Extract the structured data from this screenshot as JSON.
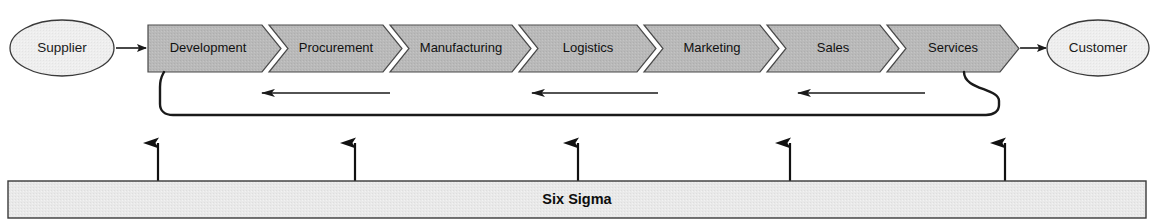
{
  "diagram": {
    "endpoints": {
      "source": {
        "label": "Supplier",
        "shape": "ellipse"
      },
      "target": {
        "label": "Customer",
        "shape": "ellipse"
      }
    },
    "stages": [
      {
        "label": "Development"
      },
      {
        "label": "Procurement"
      },
      {
        "label": "Manufacturing"
      },
      {
        "label": "Logistics"
      },
      {
        "label": "Marketing"
      },
      {
        "label": "Sales"
      },
      {
        "label": "Services"
      }
    ],
    "foundation": {
      "label": "Six Sigma"
    },
    "feedback": {
      "arrow_count": 3,
      "direction": "right-to-left",
      "description": "Feedback loop from Services back to Development"
    },
    "support_arrows": {
      "count": 5,
      "direction": "up",
      "description": "Six Sigma supports the process chain"
    },
    "colors": {
      "stage_fill": "#b9b9b9",
      "endpoint_fill": "#eeeeee",
      "foundation_fill": "#e6e6e6",
      "outline": "#3a3a3a",
      "text": "#111111",
      "background": "#ffffff"
    }
  }
}
